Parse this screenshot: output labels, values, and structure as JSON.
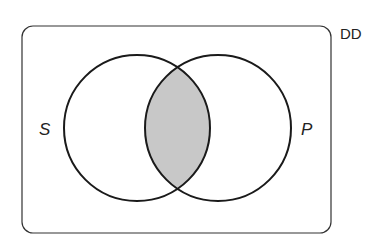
{
  "diagram": {
    "type": "venn",
    "universe_label": "DD",
    "sets": [
      {
        "name": "S",
        "cx": 137,
        "cy": 128,
        "r": 73
      },
      {
        "name": "P",
        "cx": 218,
        "cy": 128,
        "r": 73
      }
    ],
    "shaded_region": "S ∩ P",
    "colors": {
      "outline": "#1a1a1a",
      "shade": "#c8c8c8",
      "background": "#ffffff"
    }
  }
}
